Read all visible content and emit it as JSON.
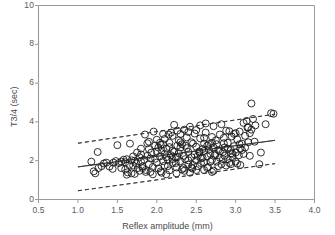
{
  "chart_data": {
    "type": "scatter",
    "title": "",
    "xlabel": "Reflex amplitude (mm)",
    "ylabel": "T3/4 (sec)",
    "xlim": [
      0.5,
      4.0
    ],
    "ylim": [
      0,
      10
    ],
    "xticks": [
      "0.5",
      "1.0",
      "1.5",
      "2.0",
      "2.5",
      "3.0",
      "3.5",
      "4.0"
    ],
    "xtick_values": [
      0.5,
      1.0,
      1.5,
      2.0,
      2.5,
      3.0,
      3.5,
      4.0
    ],
    "yticks": [
      "0",
      "2",
      "4",
      "6",
      "8",
      "10"
    ],
    "ytick_values": [
      0,
      2,
      4,
      6,
      8,
      10
    ],
    "grid": false,
    "legend": null,
    "marker": {
      "shape": "open-circle",
      "diameter_px": 7,
      "fill": "none",
      "stroke": "#1a1a1a",
      "stroke_width": 0.9
    },
    "lines": [
      {
        "name": "regression-line",
        "style": "solid",
        "color": "#333333",
        "x": [
          1.0,
          3.5
        ],
        "y": [
          1.68,
          3.05
        ]
      },
      {
        "name": "upper-confidence-band",
        "style": "dashed",
        "color": "#333333",
        "x": [
          1.0,
          3.5
        ],
        "y": [
          2.9,
          4.4
        ]
      },
      {
        "name": "lower-confidence-band",
        "style": "dashed",
        "color": "#333333",
        "x": [
          1.0,
          3.5
        ],
        "y": [
          0.45,
          1.85
        ]
      }
    ],
    "points": [
      [
        1.17,
        1.95
      ],
      [
        1.2,
        1.45
      ],
      [
        1.22,
        1.35
      ],
      [
        1.25,
        2.45
      ],
      [
        1.26,
        1.62
      ],
      [
        1.3,
        1.72
      ],
      [
        1.33,
        1.86
      ],
      [
        1.36,
        1.9
      ],
      [
        1.4,
        1.7
      ],
      [
        1.44,
        1.58
      ],
      [
        1.48,
        1.98
      ],
      [
        1.5,
        2.8
      ],
      [
        1.52,
        1.88
      ],
      [
        1.55,
        1.95
      ],
      [
        1.58,
        2.05
      ],
      [
        1.6,
        1.55
      ],
      [
        1.62,
        1.28
      ],
      [
        1.63,
        1.4
      ],
      [
        1.65,
        1.78
      ],
      [
        1.66,
        2.88
      ],
      [
        1.68,
        2.02
      ],
      [
        1.7,
        1.75
      ],
      [
        1.72,
        1.32
      ],
      [
        1.74,
        1.86
      ],
      [
        1.76,
        1.62
      ],
      [
        1.78,
        2.18
      ],
      [
        1.8,
        1.95
      ],
      [
        1.8,
        2.32
      ],
      [
        1.82,
        1.7
      ],
      [
        1.84,
        2.05
      ],
      [
        1.85,
        3.35
      ],
      [
        1.86,
        1.52
      ],
      [
        1.88,
        2.25
      ],
      [
        1.9,
        1.82
      ],
      [
        1.9,
        2.6
      ],
      [
        1.92,
        1.42
      ],
      [
        1.93,
        2.42
      ],
      [
        1.95,
        1.68
      ],
      [
        1.96,
        3.5
      ],
      [
        1.98,
        2.1
      ],
      [
        2.0,
        1.9
      ],
      [
        2.0,
        2.48
      ],
      [
        2.02,
        1.6
      ],
      [
        2.04,
        2.22
      ],
      [
        2.05,
        2.82
      ],
      [
        2.06,
        1.38
      ],
      [
        2.08,
        1.98
      ],
      [
        2.1,
        2.35
      ],
      [
        2.1,
        1.75
      ],
      [
        2.12,
        2.62
      ],
      [
        2.14,
        2.05
      ],
      [
        2.15,
        3.35
      ],
      [
        2.16,
        1.5
      ],
      [
        2.18,
        2.28
      ],
      [
        2.2,
        1.88
      ],
      [
        2.2,
        2.52
      ],
      [
        2.22,
        3.85
      ],
      [
        2.24,
        2.15
      ],
      [
        2.25,
        1.65
      ],
      [
        2.26,
        2.78
      ],
      [
        2.28,
        2.38
      ],
      [
        2.3,
        1.98
      ],
      [
        2.3,
        2.95
      ],
      [
        2.32,
        1.55
      ],
      [
        2.34,
        2.25
      ],
      [
        2.35,
        3.6
      ],
      [
        2.36,
        2.08
      ],
      [
        2.38,
        2.65
      ],
      [
        2.4,
        1.8
      ],
      [
        2.4,
        2.45
      ],
      [
        2.42,
        3.75
      ],
      [
        2.44,
        2.18
      ],
      [
        2.45,
        1.6
      ],
      [
        2.46,
        2.88
      ],
      [
        2.48,
        2.32
      ],
      [
        2.5,
        2.02
      ],
      [
        2.5,
        2.72
      ],
      [
        2.52,
        1.72
      ],
      [
        2.54,
        2.42
      ],
      [
        2.55,
        3.15
      ],
      [
        2.56,
        2.12
      ],
      [
        2.58,
        2.6
      ],
      [
        2.6,
        1.92
      ],
      [
        2.6,
        2.5
      ],
      [
        2.62,
        3.45
      ],
      [
        2.64,
        2.22
      ],
      [
        2.65,
        1.68
      ],
      [
        2.66,
        2.85
      ],
      [
        2.68,
        2.35
      ],
      [
        2.7,
        2.05
      ],
      [
        2.7,
        1.42
      ],
      [
        2.72,
        2.68
      ],
      [
        2.74,
        2.28
      ],
      [
        2.75,
        3.05
      ],
      [
        2.76,
        1.95
      ],
      [
        2.78,
        2.55
      ],
      [
        2.8,
        2.15
      ],
      [
        2.8,
        3.35
      ],
      [
        2.82,
        1.82
      ],
      [
        2.84,
        2.45
      ],
      [
        2.85,
        2.9
      ],
      [
        2.86,
        2.25
      ],
      [
        2.88,
        3.55
      ],
      [
        2.9,
        2.08
      ],
      [
        2.9,
        2.62
      ],
      [
        2.92,
        1.88
      ],
      [
        2.94,
        2.38
      ],
      [
        2.95,
        3.25
      ],
      [
        2.96,
        2.18
      ],
      [
        2.98,
        2.75
      ],
      [
        3.0,
        2.42
      ],
      [
        3.0,
        1.95
      ],
      [
        3.02,
        3.1
      ],
      [
        3.04,
        2.28
      ],
      [
        3.05,
        2.85
      ],
      [
        3.06,
        1.78
      ],
      [
        3.08,
        2.55
      ],
      [
        3.1,
        3.95
      ],
      [
        3.1,
        2.35
      ],
      [
        3.12,
        2.68
      ],
      [
        3.14,
        4.05
      ],
      [
        3.15,
        3.7
      ],
      [
        3.16,
        2.95
      ],
      [
        3.18,
        2.25
      ],
      [
        3.2,
        4.95
      ],
      [
        3.2,
        3.6
      ],
      [
        3.22,
        4.15
      ],
      [
        3.24,
        2.98
      ],
      [
        3.25,
        3.82
      ],
      [
        3.3,
        1.82
      ],
      [
        3.32,
        2.42
      ],
      [
        3.38,
        3.88
      ],
      [
        3.45,
        4.45
      ],
      [
        3.48,
        4.42
      ],
      [
        2.05,
        1.45
      ],
      [
        2.12,
        1.3
      ],
      [
        2.25,
        1.35
      ],
      [
        2.35,
        1.48
      ],
      [
        2.42,
        1.38
      ],
      [
        1.95,
        1.3
      ],
      [
        1.86,
        1.42
      ],
      [
        2.6,
        1.52
      ],
      [
        2.72,
        1.48
      ],
      [
        2.88,
        1.75
      ],
      [
        2.94,
        1.82
      ],
      [
        3.02,
        1.85
      ],
      [
        1.72,
        2.0
      ],
      [
        1.78,
        1.48
      ],
      [
        1.82,
        1.62
      ],
      [
        2.08,
        2.85
      ],
      [
        2.16,
        2.7
      ],
      [
        2.28,
        3.05
      ],
      [
        2.38,
        3.2
      ],
      [
        2.48,
        3.4
      ],
      [
        2.55,
        3.82
      ],
      [
        2.62,
        3.92
      ],
      [
        2.72,
        3.78
      ],
      [
        2.82,
        3.88
      ],
      [
        2.92,
        3.52
      ],
      [
        2.18,
        3.45
      ],
      [
        2.26,
        3.55
      ],
      [
        2.08,
        3.38
      ],
      [
        1.98,
        2.78
      ],
      [
        2.02,
        2.68
      ],
      [
        2.22,
        2.45
      ],
      [
        2.32,
        2.85
      ],
      [
        2.44,
        2.95
      ],
      [
        2.52,
        2.25
      ],
      [
        2.58,
        2.15
      ],
      [
        2.66,
        2.58
      ],
      [
        2.76,
        2.85
      ],
      [
        2.84,
        2.08
      ],
      [
        2.96,
        2.35
      ],
      [
        3.06,
        2.62
      ],
      [
        2.14,
        1.72
      ],
      [
        2.24,
        1.88
      ],
      [
        2.34,
        1.62
      ],
      [
        2.46,
        1.78
      ],
      [
        2.56,
        1.88
      ],
      [
        2.68,
        1.95
      ],
      [
        2.78,
        1.72
      ],
      [
        2.86,
        2.68
      ],
      [
        2.98,
        3.38
      ],
      [
        3.12,
        3.28
      ],
      [
        1.68,
        1.35
      ],
      [
        1.75,
        2.42
      ],
      [
        1.88,
        2.9
      ],
      [
        1.92,
        2.12
      ],
      [
        2.04,
        2.92
      ],
      [
        2.12,
        2.18
      ],
      [
        2.2,
        2.08
      ],
      [
        2.3,
        2.68
      ],
      [
        2.4,
        2.02
      ],
      [
        2.5,
        1.52
      ],
      [
        2.6,
        2.88
      ],
      [
        2.7,
        2.92
      ],
      [
        2.8,
        2.48
      ],
      [
        2.9,
        2.92
      ],
      [
        3.0,
        3.42
      ],
      [
        1.62,
        2.08
      ],
      [
        1.7,
        2.22
      ],
      [
        1.8,
        2.62
      ],
      [
        1.9,
        2.98
      ],
      [
        2.0,
        3.08
      ],
      [
        2.1,
        3.12
      ],
      [
        2.2,
        3.28
      ],
      [
        2.3,
        3.38
      ],
      [
        2.4,
        3.48
      ],
      [
        2.5,
        3.58
      ],
      [
        2.6,
        3.18
      ],
      [
        2.7,
        3.22
      ],
      [
        2.85,
        3.18
      ],
      [
        3.05,
        3.5
      ],
      [
        3.18,
        3.42
      ],
      [
        1.55,
        1.62
      ],
      [
        1.6,
        1.92
      ],
      [
        2.06,
        2.52
      ],
      [
        2.16,
        2.92
      ],
      [
        2.26,
        2.18
      ],
      [
        2.36,
        2.78
      ],
      [
        2.54,
        2.48
      ],
      [
        2.64,
        2.78
      ],
      [
        2.74,
        2.35
      ],
      [
        2.94,
        2.55
      ],
      [
        3.08,
        2.88
      ],
      [
        3.16,
        3.72
      ],
      [
        1.45,
        1.9
      ],
      [
        2.44,
        1.65
      ],
      [
        2.64,
        1.62
      ]
    ]
  },
  "axes": {
    "frame_color": "#9a9a9a"
  }
}
